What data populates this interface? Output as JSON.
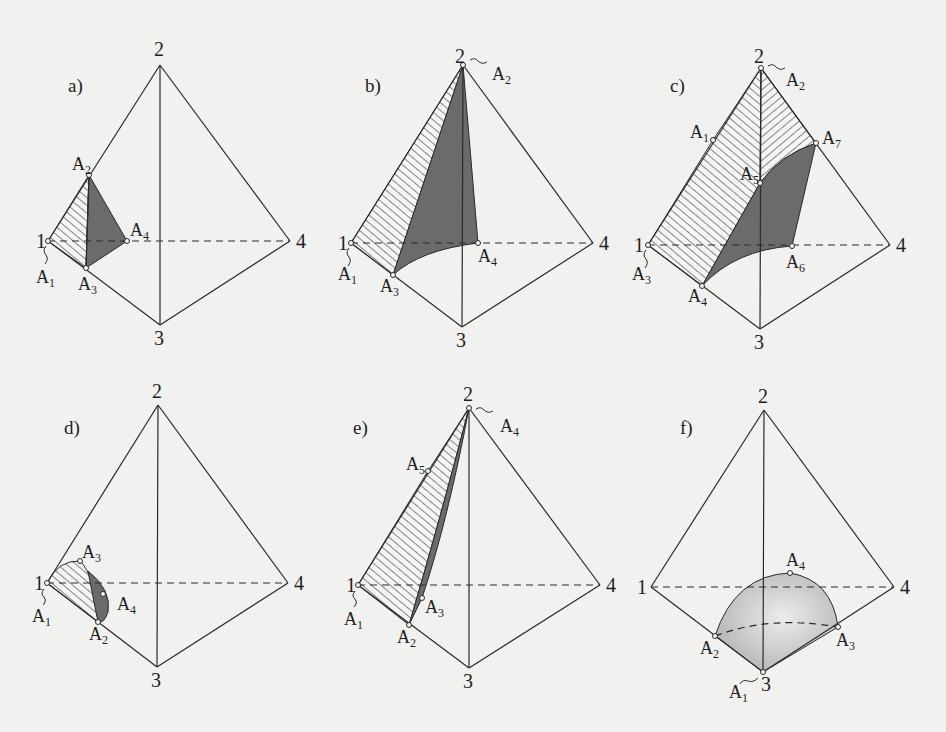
{
  "figure": {
    "colors": {
      "background": "#f1f1ef",
      "line": "#2a2a2a",
      "dark_fill": "#6b6b6b",
      "sphere_light": "#ececec",
      "sphere_dark": "#b4b4b4"
    },
    "panels": [
      {
        "id": "a",
        "label": "a)",
        "vertices": {
          "1": "1",
          "2": "2",
          "3": "3",
          "4": "4"
        },
        "points": [
          {
            "name": "A",
            "sub": "1",
            "note": "at vertex 1"
          },
          {
            "name": "A",
            "sub": "2"
          },
          {
            "name": "A",
            "sub": "3"
          },
          {
            "name": "A",
            "sub": "4"
          }
        ]
      },
      {
        "id": "b",
        "label": "b)",
        "vertices": {
          "1": "1",
          "2": "2",
          "3": "3",
          "4": "4"
        },
        "points": [
          {
            "name": "A",
            "sub": "1",
            "note": "at vertex 1"
          },
          {
            "name": "A",
            "sub": "2",
            "note": "at vertex 2"
          },
          {
            "name": "A",
            "sub": "3"
          },
          {
            "name": "A",
            "sub": "4"
          }
        ]
      },
      {
        "id": "c",
        "label": "c)",
        "vertices": {
          "1": "1",
          "2": "2",
          "3": "3",
          "4": "4"
        },
        "points": [
          {
            "name": "A",
            "sub": "1"
          },
          {
            "name": "A",
            "sub": "2",
            "note": "at vertex 2"
          },
          {
            "name": "A",
            "sub": "3",
            "note": "at vertex 1"
          },
          {
            "name": "A",
            "sub": "4"
          },
          {
            "name": "A",
            "sub": "5"
          },
          {
            "name": "A",
            "sub": "6"
          },
          {
            "name": "A",
            "sub": "7"
          }
        ]
      },
      {
        "id": "d",
        "label": "d)",
        "vertices": {
          "1": "1",
          "2": "2",
          "3": "3",
          "4": "4"
        },
        "points": [
          {
            "name": "A",
            "sub": "1",
            "note": "at vertex 1"
          },
          {
            "name": "A",
            "sub": "2"
          },
          {
            "name": "A",
            "sub": "3"
          },
          {
            "name": "A",
            "sub": "4"
          }
        ]
      },
      {
        "id": "e",
        "label": "e)",
        "vertices": {
          "1": "1",
          "2": "2",
          "3": "3",
          "4": "4"
        },
        "points": [
          {
            "name": "A",
            "sub": "1",
            "note": "at vertex 1"
          },
          {
            "name": "A",
            "sub": "2"
          },
          {
            "name": "A",
            "sub": "3"
          },
          {
            "name": "A",
            "sub": "4",
            "note": "at vertex 2"
          },
          {
            "name": "A",
            "sub": "5"
          }
        ]
      },
      {
        "id": "f",
        "label": "f)",
        "vertices": {
          "1": "1",
          "2": "2",
          "3": "3",
          "4": "4"
        },
        "points": [
          {
            "name": "A",
            "sub": "1",
            "note": "at vertex 3"
          },
          {
            "name": "A",
            "sub": "2"
          },
          {
            "name": "A",
            "sub": "3"
          },
          {
            "name": "A",
            "sub": "4"
          }
        ]
      }
    ]
  }
}
